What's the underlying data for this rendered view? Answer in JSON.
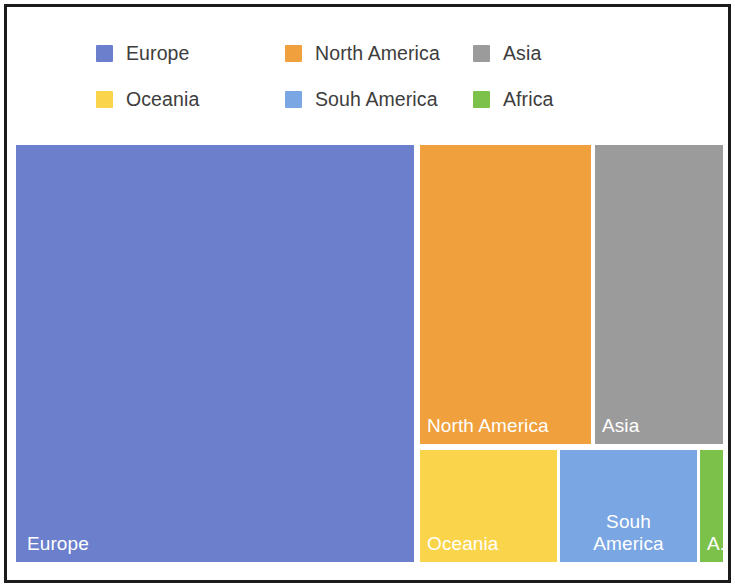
{
  "chart_data": {
    "type": "treemap",
    "title": "",
    "legend_position": "top",
    "legend": [
      {
        "label": "Europe",
        "color": "#6b7fcc"
      },
      {
        "label": "North America",
        "color": "#f0a03c"
      },
      {
        "label": "Asia",
        "color": "#9b9b9b"
      },
      {
        "label": "Oceania",
        "color": "#fad44a"
      },
      {
        "label": "Souh America",
        "color": "#7aa6e3"
      },
      {
        "label": "Africa",
        "color": "#7cc24a"
      }
    ],
    "categories": [
      "Europe",
      "North America",
      "Asia",
      "Oceania",
      "Souh America",
      "Africa"
    ],
    "values": [
      166000,
      51000,
      38000,
      15600,
      15500,
      2600
    ],
    "value_unit": "relative area",
    "tiles": [
      {
        "name": "Europe",
        "label": "Europe",
        "color": "#6b7fcc",
        "x": 0,
        "y": 0,
        "w": 398,
        "h": 417,
        "area_fraction": 0.563,
        "label_align": "bottom-left"
      },
      {
        "name": "North America",
        "label": "North America",
        "color": "#f0a03c",
        "x": 404,
        "y": 0,
        "w": 171,
        "h": 299,
        "area_fraction": 0.173,
        "label_align": "bottom-left"
      },
      {
        "name": "Asia",
        "label": "Asia",
        "color": "#9b9b9b",
        "x": 579,
        "y": 0,
        "w": 128,
        "h": 299,
        "area_fraction": 0.13,
        "label_align": "bottom-left"
      },
      {
        "name": "Oceania",
        "label": "Oceania",
        "color": "#fad44a",
        "x": 404,
        "y": 305,
        "w": 137,
        "h": 112,
        "area_fraction": 0.053,
        "label_align": "bottom-left"
      },
      {
        "name": "Souh America",
        "label": "Souh\nAmerica",
        "color": "#7aa6e3",
        "x": 544,
        "y": 305,
        "w": 137,
        "h": 112,
        "area_fraction": 0.053,
        "label_align": "bottom-center"
      },
      {
        "name": "Africa",
        "label": "A...",
        "color": "#7cc24a",
        "x": 684,
        "y": 305,
        "w": 23,
        "h": 112,
        "area_fraction": 0.009,
        "label_align": "bottom-left"
      }
    ]
  },
  "colors": {
    "background": "#ffffff",
    "frame": "#1b1b1b",
    "legend_text": "#3d3d3d",
    "tile_text": "#ffffff"
  }
}
